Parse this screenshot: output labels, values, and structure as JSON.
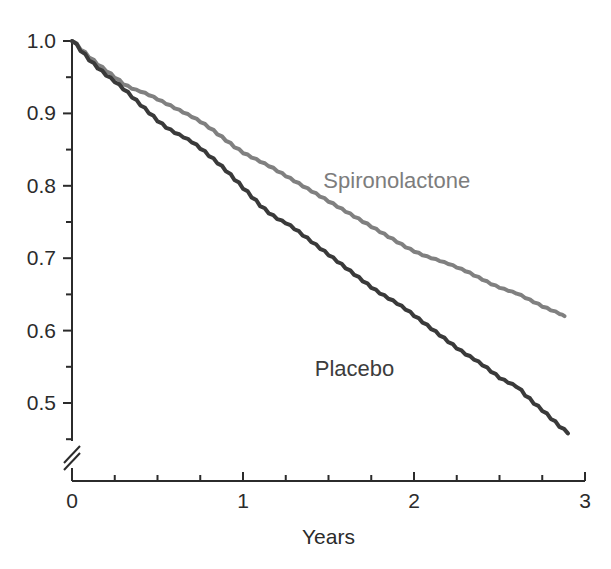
{
  "chart_data": {
    "type": "line",
    "title": "",
    "subtitle": "",
    "xlabel": "Years",
    "ylabel": "",
    "xlim": [
      0,
      3
    ],
    "ylim": [
      0.45,
      1.0
    ],
    "grid": false,
    "legend_position": "inline-annotations",
    "axis_break": {
      "axis": "y",
      "symbol": "//",
      "position": 0.465
    },
    "x_ticks": [
      0,
      1,
      2,
      3
    ],
    "x_tick_labels": [
      "0",
      "1",
      "2",
      "3"
    ],
    "x_minor_ticks": [
      0.25,
      0.5,
      0.75,
      1.25,
      1.5,
      1.75,
      2.25,
      2.5,
      2.75
    ],
    "y_ticks": [
      0.5,
      0.6,
      0.7,
      0.8,
      0.9,
      1.0
    ],
    "y_tick_labels": [
      "0.5",
      "0.6",
      "0.7",
      "0.8",
      "0.9",
      "1.0"
    ],
    "y_minor_ticks": [
      0.45,
      0.55,
      0.65,
      0.75,
      0.85,
      0.95
    ],
    "series": [
      {
        "name": "Spironolactone",
        "color": "#808080",
        "label_x": 1.47,
        "label_y": 0.825,
        "x": [
          0.0,
          0.05,
          0.1,
          0.15,
          0.2,
          0.25,
          0.3,
          0.35,
          0.4,
          0.45,
          0.5,
          0.55,
          0.6,
          0.65,
          0.7,
          0.75,
          0.8,
          0.85,
          0.9,
          0.95,
          1.0,
          1.05,
          1.1,
          1.15,
          1.2,
          1.25,
          1.3,
          1.35,
          1.4,
          1.45,
          1.5,
          1.55,
          1.6,
          1.65,
          1.7,
          1.75,
          1.8,
          1.85,
          1.9,
          1.95,
          2.0,
          2.05,
          2.1,
          2.15,
          2.2,
          2.25,
          2.3,
          2.35,
          2.4,
          2.45,
          2.5,
          2.55,
          2.6,
          2.65,
          2.7,
          2.75,
          2.8,
          2.85,
          2.88
        ],
        "y": [
          1.0,
          0.988,
          0.977,
          0.967,
          0.958,
          0.949,
          0.94,
          0.934,
          0.93,
          0.925,
          0.919,
          0.913,
          0.907,
          0.901,
          0.895,
          0.888,
          0.88,
          0.871,
          0.862,
          0.853,
          0.845,
          0.839,
          0.833,
          0.827,
          0.82,
          0.813,
          0.806,
          0.799,
          0.792,
          0.785,
          0.778,
          0.771,
          0.764,
          0.757,
          0.75,
          0.743,
          0.736,
          0.729,
          0.722,
          0.715,
          0.709,
          0.704,
          0.7,
          0.696,
          0.692,
          0.687,
          0.682,
          0.676,
          0.67,
          0.664,
          0.659,
          0.655,
          0.651,
          0.645,
          0.639,
          0.633,
          0.628,
          0.623,
          0.62
        ]
      },
      {
        "name": "Placebo",
        "color": "#3a3a3a",
        "label_x": 1.42,
        "label_y": 0.565,
        "x": [
          0.0,
          0.05,
          0.1,
          0.15,
          0.2,
          0.25,
          0.3,
          0.35,
          0.4,
          0.45,
          0.5,
          0.55,
          0.6,
          0.65,
          0.7,
          0.75,
          0.8,
          0.85,
          0.9,
          0.95,
          1.0,
          1.05,
          1.1,
          1.15,
          1.2,
          1.25,
          1.3,
          1.35,
          1.4,
          1.45,
          1.5,
          1.55,
          1.6,
          1.65,
          1.7,
          1.75,
          1.8,
          1.85,
          1.9,
          1.95,
          2.0,
          2.05,
          2.1,
          2.15,
          2.2,
          2.25,
          2.3,
          2.35,
          2.4,
          2.45,
          2.5,
          2.55,
          2.6,
          2.65,
          2.7,
          2.75,
          2.8,
          2.85,
          2.9
        ],
        "y": [
          1.0,
          0.986,
          0.973,
          0.962,
          0.952,
          0.943,
          0.933,
          0.922,
          0.911,
          0.9,
          0.889,
          0.88,
          0.873,
          0.867,
          0.86,
          0.851,
          0.841,
          0.831,
          0.82,
          0.808,
          0.796,
          0.784,
          0.772,
          0.762,
          0.754,
          0.748,
          0.74,
          0.731,
          0.722,
          0.713,
          0.704,
          0.695,
          0.686,
          0.677,
          0.668,
          0.659,
          0.651,
          0.644,
          0.637,
          0.629,
          0.62,
          0.611,
          0.602,
          0.593,
          0.584,
          0.575,
          0.567,
          0.56,
          0.552,
          0.543,
          0.534,
          0.528,
          0.522,
          0.51,
          0.499,
          0.489,
          0.478,
          0.467,
          0.458
        ]
      }
    ]
  },
  "axes": {
    "x_title": "Years",
    "y_title": ""
  },
  "colors": {
    "spironolactone": "#808080",
    "placebo": "#3a3a3a",
    "axis": "#2b2b2b",
    "background": "#ffffff"
  }
}
